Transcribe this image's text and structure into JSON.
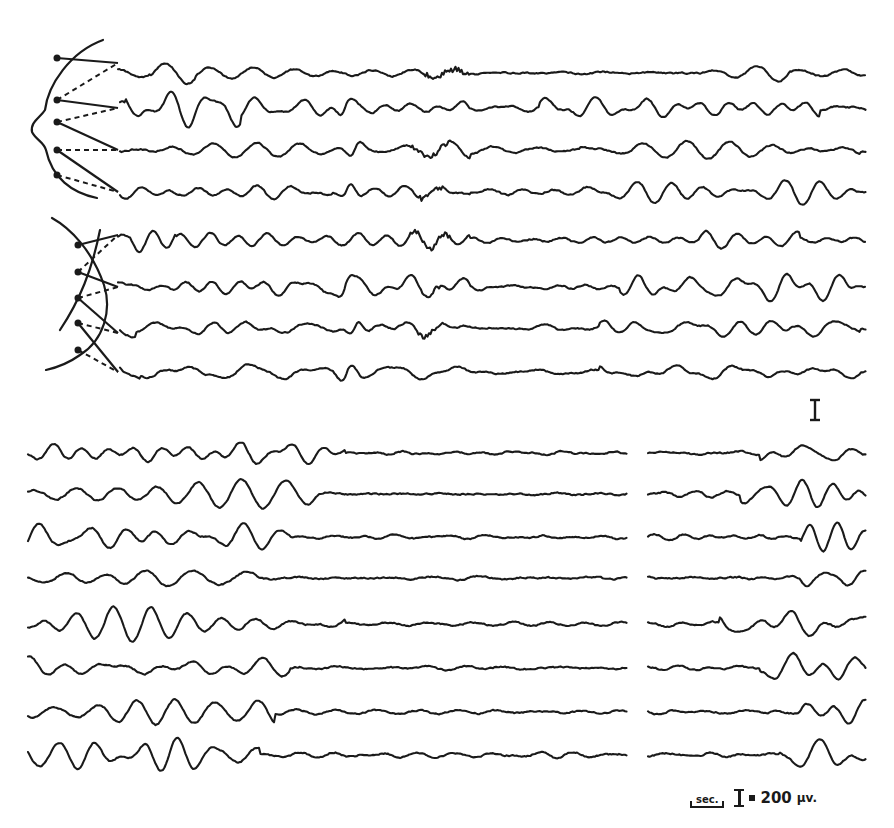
{
  "figure": {
    "type": "EEG recording",
    "background": "#ffffff",
    "ink_color": "#1a1a1a"
  },
  "top_section": {
    "montages": [
      {
        "name": "upper-montage",
        "view": "frontal head outline (left profile)",
        "electrodes": 5,
        "channels": [
          {
            "y": 73,
            "x_start": 118,
            "x_end": 866,
            "burst_at": [
              150,
              195
            ],
            "spike_at": null,
            "fast_at": [
              425,
              470
            ],
            "late_activity": [
              700,
              790
            ]
          },
          {
            "y": 108,
            "x_start": 120,
            "x_end": 866,
            "burst_at": [
              125,
              240
            ],
            "spike_at": 345,
            "fast_at": null,
            "late_activity": [
              540,
              820
            ]
          },
          {
            "y": 150,
            "x_start": 120,
            "x_end": 866,
            "burst_at": null,
            "spike_at": 355,
            "fast_at": [
              410,
              450
            ],
            "late_activity": [
              580,
              860
            ]
          },
          {
            "y": 192,
            "x_start": 120,
            "x_end": 866,
            "burst_at": null,
            "spike_at": 347,
            "fast_at": [
              420,
              445
            ],
            "late_activity": [
              580,
              860
            ]
          }
        ]
      },
      {
        "name": "lower-montage",
        "view": "lateral head outline (crossing leads)",
        "electrodes": 5,
        "channels": [
          {
            "y": 240,
            "x_start": 118,
            "x_end": 866,
            "burst_at": [
              130,
              175
            ],
            "spike_at": null,
            "fast_at": [
              410,
              450
            ],
            "late_activity": [
              700,
              800
            ]
          },
          {
            "y": 287,
            "x_start": 118,
            "x_end": 866,
            "burst_at": null,
            "spike_at": 345,
            "fast_at": [
              420,
              440
            ],
            "late_activity": [
              620,
              850
            ]
          },
          {
            "y": 328,
            "x_start": 120,
            "x_end": 866,
            "burst_at": [
              120,
              135
            ],
            "spike_at": 355,
            "fast_at": [
              415,
              445
            ],
            "late_activity": [
              600,
              860
            ]
          },
          {
            "y": 372,
            "x_start": 120,
            "x_end": 866,
            "burst_at": [
              120,
              140
            ],
            "spike_at": 347,
            "fast_at": null,
            "late_activity": [
              600,
              860
            ]
          }
        ]
      }
    ],
    "calibration_mark": {
      "x": 815,
      "y_top": 400,
      "y_bottom": 420,
      "label": "I"
    }
  },
  "bottom_section": {
    "segments": [
      {
        "x_start": 28,
        "x_end": 627
      },
      {
        "x_start": 648,
        "x_end": 866
      }
    ],
    "channels": [
      {
        "y": 453,
        "left_activity_end": 345,
        "right_burst": [
          760,
          866
        ]
      },
      {
        "y": 494,
        "left_activity_end": 320,
        "right_burst": [
          740,
          866
        ]
      },
      {
        "y": 537,
        "left_activity_end": 290,
        "right_burst": [
          800,
          866
        ]
      },
      {
        "y": 578,
        "left_activity_end": 260,
        "right_burst": [
          800,
          866
        ]
      },
      {
        "y": 624,
        "left_activity_end": 345,
        "right_burst": [
          720,
          866
        ]
      },
      {
        "y": 668,
        "left_activity_end": 290,
        "right_burst": [
          760,
          866
        ]
      },
      {
        "y": 712,
        "left_activity_end": 275,
        "right_burst": [
          800,
          866
        ]
      },
      {
        "y": 755,
        "left_activity_end": 260,
        "right_burst": [
          780,
          866
        ]
      }
    ]
  },
  "legend": {
    "time_scale_label": "sec.",
    "amplitude_scale_symbol": "I",
    "amplitude_scale_equals": "=",
    "amplitude_scale_value": "200",
    "amplitude_scale_unit": "µv."
  }
}
